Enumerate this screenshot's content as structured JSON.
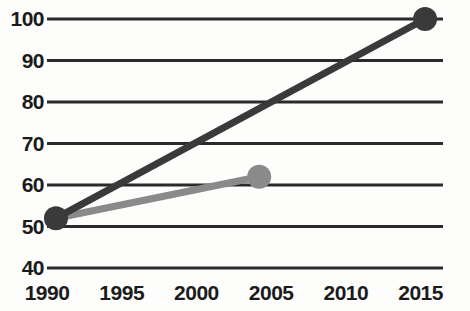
{
  "chart_data": {
    "type": "line",
    "title": "",
    "subtitle": "",
    "xlabel": "",
    "ylabel": "",
    "xlim": [
      1990,
      2016.5
    ],
    "ylim": [
      40,
      100
    ],
    "grid": "horizontal",
    "legend": "none",
    "y_ticks": [
      100,
      90,
      80,
      70,
      60,
      50,
      40
    ],
    "x_ticks": [
      1990,
      1995,
      2000,
      2005,
      2010,
      2015
    ],
    "x_tick_labels": [
      "1990",
      "1995",
      "2000",
      "2005",
      "2010",
      "2015"
    ],
    "y_tick_labels": [
      "100",
      "90",
      "80",
      "70",
      "60",
      "50",
      "40"
    ],
    "series": [
      {
        "name": "dark-series",
        "color": "#3a3a3a",
        "marker_color": "#3a3a3a",
        "x": [
          1990.6,
          2015.3
        ],
        "y": [
          52,
          100
        ],
        "markers": [
          {
            "x": 1990.6,
            "y": 52
          },
          {
            "x": 2015.3,
            "y": 100
          }
        ]
      },
      {
        "name": "gray-series",
        "color": "#8a8a8a",
        "marker_color": "#8a8a8a",
        "x": [
          1990.6,
          2004.2
        ],
        "y": [
          52,
          62
        ],
        "markers": [
          {
            "x": 2004.2,
            "y": 62
          }
        ]
      }
    ]
  },
  "axis": {
    "y_labels": [
      "100",
      "90",
      "80",
      "70",
      "60",
      "50",
      "40"
    ],
    "x_labels": [
      "1990",
      "1995",
      "2000",
      "2005",
      "2010",
      "2015"
    ]
  },
  "colors": {
    "dark_line": "#3a3a3a",
    "gray_line": "#8a8a8a",
    "gridline": "#2b2b2b",
    "text": "#1b1b1b",
    "background": "#fdfdfb"
  }
}
